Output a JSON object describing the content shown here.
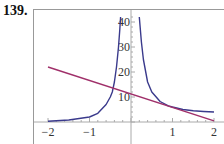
{
  "problem_number": "139.",
  "colors": {
    "curve": "#3a3a8c",
    "line": "#a0306a",
    "axis": "#aaaaaa",
    "frame": "#999999"
  },
  "chart_data": {
    "type": "line",
    "title": "",
    "xlabel": "",
    "ylabel": "",
    "xlim": [
      -2.05,
      2.2
    ],
    "ylim": [
      -1,
      44
    ],
    "grid": false,
    "legend": null,
    "x_ticks": [
      -2,
      -1,
      1,
      2
    ],
    "x_tick_labels": [
      "−2",
      "−1",
      "1",
      "2"
    ],
    "y_ticks": [
      10,
      20,
      30,
      40
    ],
    "y_tick_labels": [
      "10",
      "20",
      "30",
      "40"
    ],
    "series": [
      {
        "name": "curve-left-branch",
        "color": "#3a3a8c",
        "x": [
          -2,
          -1.5,
          -1,
          -0.8,
          -0.6,
          -0.5,
          -0.45,
          -0.4,
          -0.35,
          -0.3,
          -0.27,
          -0.25
        ],
        "y": [
          0.3,
          0.8,
          2,
          3.5,
          7,
          10,
          12,
          16,
          22,
          30,
          37,
          42
        ]
      },
      {
        "name": "curve-right-branch",
        "color": "#3a3a8c",
        "x": [
          0.2,
          0.25,
          0.3,
          0.4,
          0.5,
          0.7,
          0.9,
          1,
          1.25,
          1.5,
          1.75,
          2
        ],
        "y": [
          42,
          32,
          25,
          16,
          12,
          8.2,
          6.5,
          6,
          5,
          4.5,
          4.2,
          4
        ]
      },
      {
        "name": "line",
        "color": "#a0306a",
        "x": [
          -2,
          2
        ],
        "y": [
          22,
          0.5
        ]
      }
    ]
  }
}
